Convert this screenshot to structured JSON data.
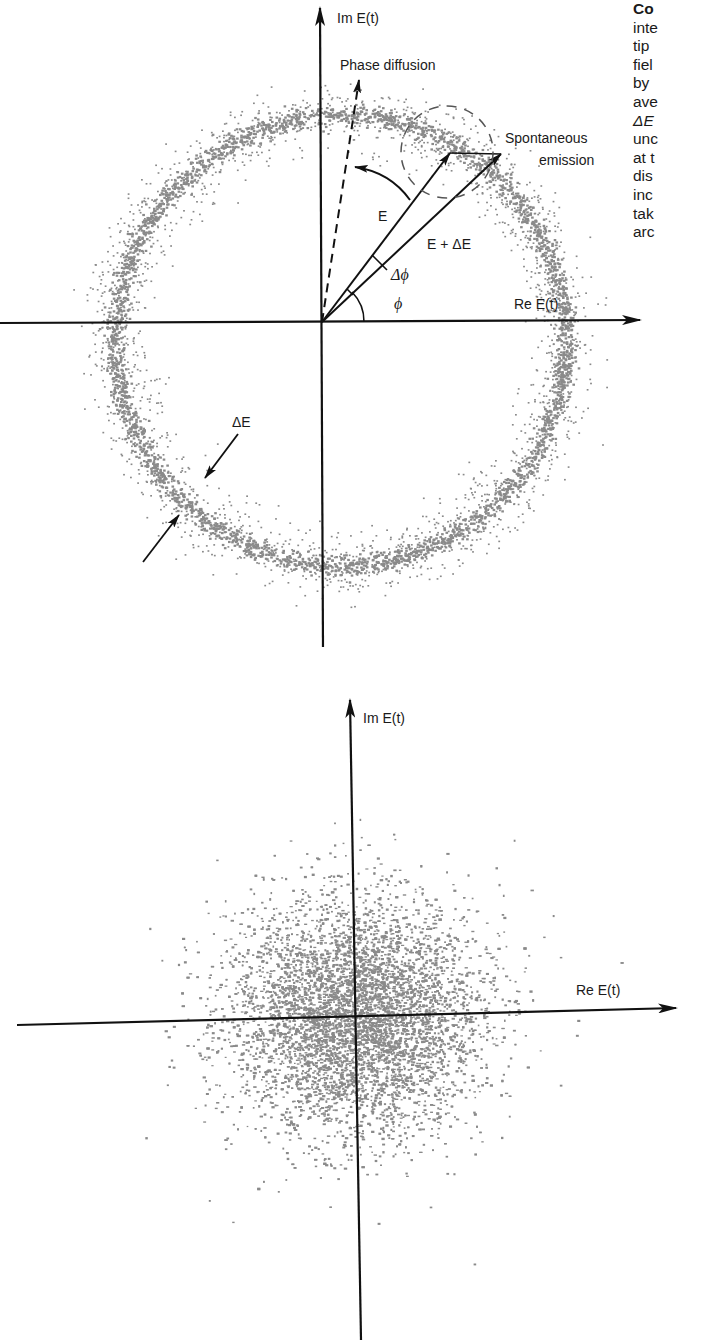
{
  "figure": {
    "top_diagram": {
      "axes": {
        "y_label": "Im E(t)",
        "x_label": "Re E(t)"
      },
      "labels": {
        "phase_diffusion": "Phase diffusion",
        "spontaneous_emission_line1": "Spontaneous",
        "spontaneous_emission_line2": "emission",
        "vector_E": "E",
        "vector_E_plus_dE": "E + ΔE",
        "delta_phi": "Δϕ",
        "phi": "ϕ",
        "delta_E": "ΔE"
      },
      "description": "Ring of scattered points (coherent field with amplitude noise) with phasor E and perturbed phasor E+ΔE from spontaneous emission"
    },
    "bottom_diagram": {
      "axes": {
        "y_label": "Im E(t)",
        "x_label": "Re E(t)"
      },
      "description": "Gaussian cloud of points centered at origin (chaotic/thermal field)"
    },
    "caption_fragments": [
      "Co",
      "inte",
      "tip",
      "fiel",
      "by",
      "ave",
      "ΔE",
      "unc",
      "at t",
      "dis",
      "inc",
      "tak",
      "arc"
    ],
    "colors": {
      "ink": "#111111",
      "dots": "#8a8a8a",
      "background": "#ffffff"
    }
  }
}
